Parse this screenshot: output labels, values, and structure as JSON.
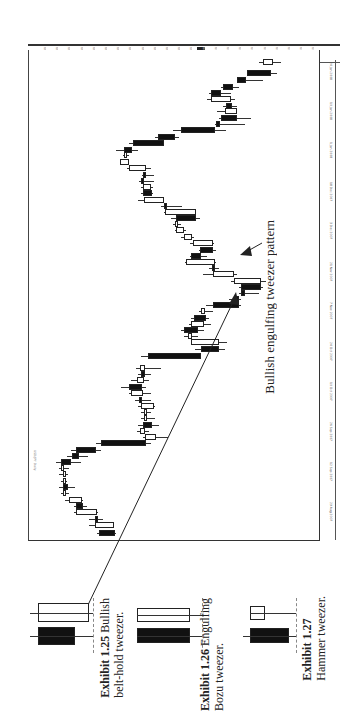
{
  "page": {
    "orientation": "rotated-90-clockwise",
    "annotation": "Bullish engulfing tweezer pattern"
  },
  "chart": {
    "header": "USD/JPY Daily",
    "price_axis_labels": [
      "119.50",
      "118.75",
      "118.00",
      "117.25",
      "116.50",
      "115.75",
      "115.00",
      "114.25",
      "113.50",
      "112.75",
      "112.00",
      "111.25",
      "110.50",
      "109.75",
      "109.00",
      "108.25",
      "107.50",
      "106.75",
      "106.00",
      "105.25",
      "104.50",
      "103.75",
      "103.00"
    ],
    "price_axis_highlight": "107.02",
    "date_axis_labels": [
      "24 Jan 2008",
      "10 Jan 2008",
      "1 Jan 2008",
      "18 Dec 2007",
      "3 Dec 2007",
      "21 Nov 2007",
      "7 Nov 2007",
      "24 Oct 2007",
      "10 Oct 2007",
      "26 Sep 2007",
      "12 Sep 2007",
      "29 Aug 2007"
    ],
    "candles": [
      {
        "y": 62,
        "lo": 258,
        "hi": 280,
        "bo": 262,
        "bc": 272,
        "c": "white"
      },
      {
        "y": 73,
        "lo": 246,
        "hi": 276,
        "bo": 246,
        "bc": 270,
        "c": "black"
      },
      {
        "y": 80,
        "lo": 236,
        "hi": 262,
        "bo": 236,
        "bc": 245,
        "c": "black"
      },
      {
        "y": 87,
        "lo": 220,
        "hi": 238,
        "bo": 222,
        "bc": 232,
        "c": "black"
      },
      {
        "y": 93,
        "lo": 208,
        "hi": 230,
        "bo": 210,
        "bc": 220,
        "c": "black"
      },
      {
        "y": 99,
        "lo": 206,
        "hi": 234,
        "bo": 210,
        "bc": 230,
        "c": "white"
      },
      {
        "y": 106,
        "lo": 222,
        "hi": 236,
        "bo": 225,
        "bc": 231,
        "c": "black"
      },
      {
        "y": 111,
        "lo": 216,
        "hi": 236,
        "bo": 224,
        "bc": 236,
        "c": "white"
      },
      {
        "y": 118,
        "lo": 218,
        "hi": 250,
        "bo": 220,
        "bc": 236,
        "c": "black"
      },
      {
        "y": 124,
        "lo": 214,
        "hi": 244,
        "bo": 215,
        "bc": 219,
        "c": "black"
      },
      {
        "y": 130,
        "lo": 172,
        "hi": 225,
        "bo": 180,
        "bc": 214,
        "c": "black"
      },
      {
        "y": 137,
        "lo": 154,
        "hi": 178,
        "bo": 157,
        "bc": 174,
        "c": "black"
      },
      {
        "y": 143,
        "lo": 128,
        "hi": 163,
        "bo": 132,
        "bc": 163,
        "c": "black"
      },
      {
        "y": 150,
        "lo": 115,
        "hi": 137,
        "bo": 123,
        "bc": 131,
        "c": "black"
      },
      {
        "y": 155,
        "lo": 122,
        "hi": 128,
        "bo": 123,
        "bc": 126,
        "c": "white"
      },
      {
        "y": 162,
        "lo": 119,
        "hi": 128,
        "bo": 119,
        "bc": 128,
        "c": "white"
      },
      {
        "y": 168,
        "lo": 126,
        "hi": 150,
        "bo": 128,
        "bc": 145,
        "c": "white"
      },
      {
        "y": 175,
        "lo": 141,
        "hi": 153,
        "bo": 142,
        "bc": 145,
        "c": "black"
      },
      {
        "y": 181,
        "lo": 138,
        "hi": 153,
        "bo": 140,
        "bc": 141,
        "c": "black"
      },
      {
        "y": 187,
        "lo": 140,
        "hi": 152,
        "bo": 142,
        "bc": 150,
        "c": "white"
      },
      {
        "y": 193,
        "lo": 140,
        "hi": 152,
        "bo": 142,
        "bc": 151,
        "c": "black"
      },
      {
        "y": 200,
        "lo": 137,
        "hi": 163,
        "bo": 143,
        "bc": 163,
        "c": "white"
      },
      {
        "y": 206,
        "lo": 160,
        "hi": 181,
        "bo": 163,
        "bc": 164,
        "c": "black"
      },
      {
        "y": 212,
        "lo": 163,
        "hi": 195,
        "bo": 164,
        "bc": 195,
        "c": "white"
      },
      {
        "y": 218,
        "lo": 170,
        "hi": 199,
        "bo": 175,
        "bc": 195,
        "c": "black"
      },
      {
        "y": 224,
        "lo": 172,
        "hi": 180,
        "bo": 174,
        "bc": 177,
        "c": "white"
      },
      {
        "y": 230,
        "lo": 174,
        "hi": 185,
        "bo": 175,
        "bc": 183,
        "c": "white"
      },
      {
        "y": 237,
        "lo": 180,
        "hi": 193,
        "bo": 183,
        "bc": 191,
        "c": "white"
      },
      {
        "y": 243,
        "lo": 189,
        "hi": 213,
        "bo": 192,
        "bc": 212,
        "c": "white"
      },
      {
        "y": 250,
        "lo": 198,
        "hi": 215,
        "bo": 199,
        "bc": 212,
        "c": "black"
      },
      {
        "y": 256,
        "lo": 189,
        "hi": 206,
        "bo": 190,
        "bc": 200,
        "c": "black"
      },
      {
        "y": 262,
        "lo": 184,
        "hi": 215,
        "bo": 185,
        "bc": 214,
        "c": "white"
      },
      {
        "y": 268,
        "lo": 208,
        "hi": 218,
        "bo": 211,
        "bc": 212,
        "c": "black"
      },
      {
        "y": 274,
        "lo": 202,
        "hi": 236,
        "bo": 212,
        "bc": 233,
        "c": "white"
      },
      {
        "y": 281,
        "lo": 230,
        "hi": 265,
        "bo": 233,
        "bc": 260,
        "c": "white"
      },
      {
        "y": 287,
        "lo": 238,
        "hi": 262,
        "bo": 240,
        "bc": 260,
        "c": "black"
      },
      {
        "y": 293,
        "lo": 238,
        "hi": 258,
        "bo": 240,
        "bc": 244,
        "c": "black"
      },
      {
        "y": 299,
        "lo": 228,
        "hi": 240,
        "bo": 235,
        "bc": 236,
        "c": "black"
      },
      {
        "y": 305,
        "lo": 205,
        "hi": 240,
        "bo": 212,
        "bc": 238,
        "c": "black"
      },
      {
        "y": 311,
        "lo": 198,
        "hi": 212,
        "bo": 200,
        "bc": 204,
        "c": "white"
      },
      {
        "y": 318,
        "lo": 190,
        "hi": 208,
        "bo": 193,
        "bc": 205,
        "c": "black"
      },
      {
        "y": 324,
        "lo": 188,
        "hi": 210,
        "bo": 190,
        "bc": 203,
        "c": "white"
      },
      {
        "y": 330,
        "lo": 180,
        "hi": 203,
        "bo": 183,
        "bc": 197,
        "c": "black"
      },
      {
        "y": 336,
        "lo": 183,
        "hi": 197,
        "bo": 187,
        "bc": 191,
        "c": "white"
      },
      {
        "y": 342,
        "lo": 190,
        "hi": 226,
        "bo": 190,
        "bc": 218,
        "c": "white"
      },
      {
        "y": 349,
        "lo": 194,
        "hi": 224,
        "bo": 200,
        "bc": 218,
        "c": "black"
      },
      {
        "y": 356,
        "lo": 140,
        "hi": 200,
        "bo": 147,
        "bc": 200,
        "c": "black"
      },
      {
        "y": 368,
        "lo": 135,
        "hi": 160,
        "bo": 139,
        "bc": 144,
        "c": "white"
      },
      {
        "y": 374,
        "lo": 137,
        "hi": 150,
        "bo": 140,
        "bc": 144,
        "c": "black"
      },
      {
        "y": 380,
        "lo": 130,
        "hi": 148,
        "bo": 136,
        "bc": 143,
        "c": "white"
      },
      {
        "y": 387,
        "lo": 120,
        "hi": 145,
        "bo": 128,
        "bc": 141,
        "c": "black"
      },
      {
        "y": 393,
        "lo": 128,
        "hi": 150,
        "bo": 130,
        "bc": 142,
        "c": "white"
      },
      {
        "y": 400,
        "lo": 134,
        "hi": 150,
        "bo": 138,
        "bc": 140,
        "c": "black"
      },
      {
        "y": 406,
        "lo": 137,
        "hi": 154,
        "bo": 140,
        "bc": 153,
        "c": "white"
      },
      {
        "y": 412,
        "lo": 140,
        "hi": 150,
        "bo": 143,
        "bc": 145,
        "c": "white"
      },
      {
        "y": 418,
        "lo": 140,
        "hi": 154,
        "bo": 143,
        "bc": 145,
        "c": "white"
      },
      {
        "y": 425,
        "lo": 137,
        "hi": 158,
        "bo": 142,
        "bc": 151,
        "c": "black"
      },
      {
        "y": 431,
        "lo": 136,
        "hi": 148,
        "bo": 139,
        "bc": 144,
        "c": "white"
      },
      {
        "y": 437,
        "lo": 142,
        "hi": 167,
        "bo": 144,
        "bc": 155,
        "c": "white"
      },
      {
        "y": 443,
        "lo": 95,
        "hi": 150,
        "bo": 100,
        "bc": 145,
        "c": "black"
      },
      {
        "y": 450,
        "lo": 70,
        "hi": 100,
        "bo": 75,
        "bc": 95,
        "c": "black"
      },
      {
        "y": 456,
        "lo": 66,
        "hi": 87,
        "bo": 71,
        "bc": 78,
        "c": "black"
      },
      {
        "y": 462,
        "lo": 55,
        "hi": 80,
        "bo": 60,
        "bc": 70,
        "c": "black"
      },
      {
        "y": 468,
        "lo": 58,
        "hi": 68,
        "bo": 60,
        "bc": 63,
        "c": "white"
      },
      {
        "y": 474,
        "lo": 58,
        "hi": 67,
        "bo": 62,
        "bc": 65,
        "c": "white"
      },
      {
        "y": 481,
        "lo": 60,
        "hi": 66,
        "bo": 62,
        "bc": 64,
        "c": "white"
      },
      {
        "y": 487,
        "lo": 58,
        "hi": 74,
        "bo": 62,
        "bc": 67,
        "c": "black"
      },
      {
        "y": 493,
        "lo": 60,
        "hi": 68,
        "bo": 62,
        "bc": 65,
        "c": "white"
      },
      {
        "y": 500,
        "lo": 64,
        "hi": 82,
        "bo": 68,
        "bc": 81,
        "c": "white"
      },
      {
        "y": 506,
        "lo": 73,
        "hi": 86,
        "bo": 75,
        "bc": 82,
        "c": "black"
      },
      {
        "y": 512,
        "lo": 73,
        "hi": 97,
        "bo": 75,
        "bc": 96,
        "c": "white"
      },
      {
        "y": 519,
        "lo": 88,
        "hi": 102,
        "bo": 94,
        "bc": 96,
        "c": "black"
      },
      {
        "y": 525,
        "lo": 88,
        "hi": 113,
        "bo": 94,
        "bc": 113,
        "c": "white"
      },
      {
        "y": 533,
        "lo": 96,
        "hi": 115,
        "bo": 98,
        "bc": 114,
        "c": "black"
      }
    ]
  },
  "exhibits": [
    {
      "number": "Exhibit 1.25",
      "title": "Bullish",
      "subtitle": "belt-hold tweezer.",
      "candles": [
        {
          "color": "black",
          "body_top": 627,
          "body_bottom": 645,
          "left": 38,
          "right": 75,
          "wick_left": 30
        },
        {
          "color": "white",
          "body_top": 603,
          "body_bottom": 622,
          "left": 38,
          "right": 89,
          "wick_left": 30
        }
      ]
    },
    {
      "number": "Exhibit 1.26",
      "title": "Engulfing",
      "subtitle": "Bozu tweezer.",
      "candles": [
        {
          "color": "black",
          "body_top": 628,
          "body_bottom": 643,
          "left": 137,
          "right": 190
        },
        {
          "color": "white",
          "body_top": 608,
          "body_bottom": 622,
          "left": 137,
          "right": 190
        }
      ]
    },
    {
      "number": "Exhibit 1.27",
      "title": "",
      "subtitle": "Hammer tweezer.",
      "candles": [
        {
          "color": "black",
          "body_top": 628,
          "body_bottom": 643,
          "left": 250,
          "right": 289,
          "wick_left": 243
        },
        {
          "color": "white",
          "body_top": 606,
          "body_bottom": 620,
          "left": 250,
          "right": 265
        }
      ]
    }
  ]
}
